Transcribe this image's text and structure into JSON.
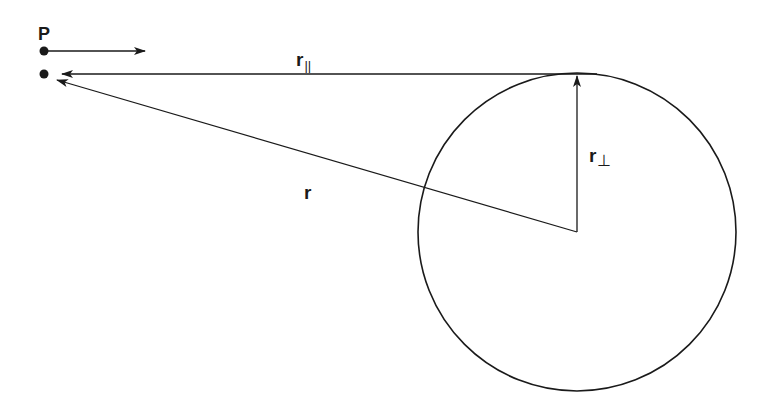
{
  "diagram": {
    "type": "vector-geometry",
    "colors": {
      "stroke": "#1a1a1a",
      "background": "#ffffff"
    },
    "point_label": "P",
    "labels": {
      "r_parallel": {
        "main": "r",
        "sub": "||"
      },
      "r_perp": {
        "main": "r",
        "sub": "⊥"
      },
      "r": {
        "main": "r"
      }
    },
    "geometry": {
      "circle": {
        "cx": 577,
        "cy": 232,
        "r": 159
      },
      "point_P_upper": {
        "x": 44,
        "y": 51
      },
      "point_P_lower": {
        "x": 44,
        "y": 74
      },
      "velocity_arrow": {
        "x1": 44,
        "y1": 51,
        "x2": 145,
        "y2": 51
      },
      "r_parallel_arrow": {
        "x1": 597,
        "y1": 74,
        "x2": 62,
        "y2": 74
      },
      "r_perp_arrow": {
        "x1": 577,
        "y1": 232,
        "x2": 577,
        "y2": 76
      },
      "r_arrow": {
        "x1": 577,
        "y1": 232,
        "x2": 58,
        "y2": 80
      }
    }
  }
}
